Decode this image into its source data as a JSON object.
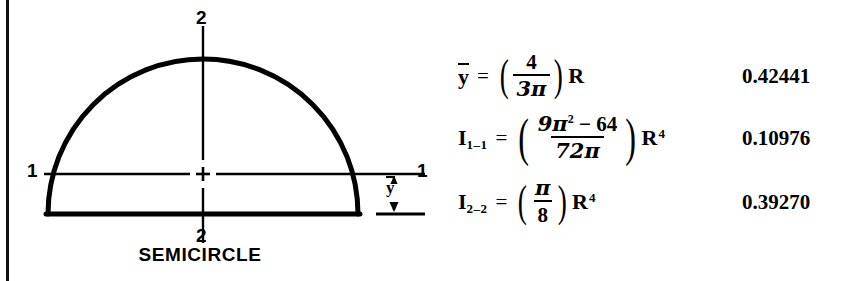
{
  "figure": {
    "caption": "SEMICIRCLE",
    "axis_labels": {
      "top_2": "2",
      "bottom_2": "2",
      "left_1": "1",
      "right_1": "1"
    },
    "dimension_label": "y",
    "centroid_marker": "+",
    "stroke_color": "#000000",
    "background": "#ffffff"
  },
  "equations": [
    {
      "lhs": "y",
      "lhs_sub": "",
      "equals": "=",
      "numerator": "4",
      "denominator": "3π",
      "numerator_sup": "",
      "multiplier": "R",
      "multiplier_sup": "",
      "value": "0.42441"
    },
    {
      "lhs": "I",
      "lhs_sub": "1–1",
      "equals": "=",
      "numerator": "9π",
      "numerator_sup": "2",
      "numerator_tail": "− 64",
      "denominator": "72π",
      "multiplier": "R",
      "multiplier_sup": "4",
      "value": "0.10976"
    },
    {
      "lhs": "I",
      "lhs_sub": "2–2",
      "equals": "=",
      "numerator": "π",
      "numerator_sup": "",
      "denominator": "8",
      "multiplier": "R",
      "multiplier_sup": "4",
      "value": "0.39270"
    }
  ]
}
